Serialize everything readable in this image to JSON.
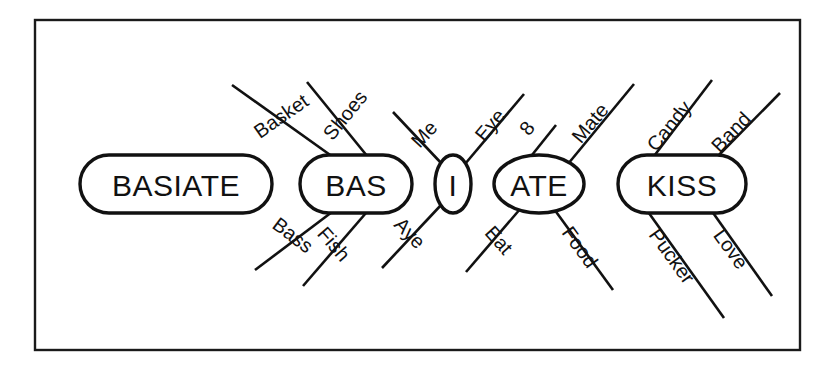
{
  "figure": {
    "background_color": "#ffffff",
    "stroke_color": "#111111",
    "frame": {
      "x": 35,
      "y": 20,
      "width": 765,
      "height": 330
    }
  },
  "nodes": [
    {
      "id": "basiate",
      "label": "BASIATE",
      "shape": "rounded-rect",
      "cx": 176,
      "cy": 184,
      "rx": 96,
      "ry": 29,
      "font_size": 30
    },
    {
      "id": "bas",
      "label": "BAS",
      "shape": "rounded-rect",
      "cx": 356,
      "cy": 184,
      "rx": 56,
      "ry": 29,
      "font_size": 30
    },
    {
      "id": "i",
      "label": "I",
      "shape": "ellipse",
      "cx": 453,
      "cy": 184,
      "rx": 18,
      "ry": 29,
      "font_size": 30
    },
    {
      "id": "ate",
      "label": "ATE",
      "shape": "ellipse",
      "cx": 539,
      "cy": 184,
      "rx": 45,
      "ry": 29,
      "font_size": 30
    },
    {
      "id": "kiss",
      "label": "KISS",
      "shape": "rounded-rect",
      "cx": 682,
      "cy": 184,
      "rx": 64,
      "ry": 29,
      "font_size": 30
    }
  ],
  "associations": [
    {
      "id": "bas-basket",
      "label": "Basket",
      "source_node": "bas",
      "direction": "upper-left",
      "x1": 340,
      "y1": 162,
      "x2": 232,
      "y2": 85,
      "label_x": 281,
      "label_y": 116,
      "label_rotation": -35,
      "font_size": 20
    },
    {
      "id": "bas-shoes",
      "label": "Shoes",
      "source_node": "bas",
      "direction": "upper-right",
      "x1": 372,
      "y1": 162,
      "x2": 307,
      "y2": 82,
      "label_x": 345,
      "label_y": 115,
      "label_rotation": -51,
      "font_size": 20
    },
    {
      "id": "bas-bass",
      "label": "Bass",
      "source_node": "bas",
      "direction": "lower-left",
      "x1": 340,
      "y1": 206,
      "x2": 255,
      "y2": 270,
      "label_x": 293,
      "label_y": 235,
      "label_rotation": 37,
      "font_size": 20
    },
    {
      "id": "bas-fish",
      "label": "Fish",
      "source_node": "bas",
      "direction": "lower-right",
      "x1": 372,
      "y1": 206,
      "x2": 303,
      "y2": 286,
      "label_x": 334,
      "label_y": 244,
      "label_rotation": 49,
      "font_size": 20
    },
    {
      "id": "i-me",
      "label": "Me",
      "source_node": "i",
      "direction": "upper-left",
      "x1": 442,
      "y1": 164,
      "x2": 393,
      "y2": 112,
      "label_x": 424,
      "label_y": 134,
      "label_rotation": -47,
      "font_size": 20
    },
    {
      "id": "i-eye",
      "label": "Eye",
      "source_node": "i",
      "direction": "upper-right",
      "x1": 465,
      "y1": 164,
      "x2": 524,
      "y2": 94,
      "label_x": 490,
      "label_y": 125,
      "label_rotation": -50,
      "font_size": 20
    },
    {
      "id": "i-aye",
      "label": "Aye",
      "source_node": "i",
      "direction": "lower-left",
      "x1": 442,
      "y1": 204,
      "x2": 382,
      "y2": 268,
      "label_x": 410,
      "label_y": 233,
      "label_rotation": 46,
      "font_size": 20
    },
    {
      "id": "ate-eight",
      "label": "8",
      "source_node": "ate",
      "direction": "upper-right-short",
      "x1": 528,
      "y1": 160,
      "x2": 556,
      "y2": 125,
      "label_x": 527,
      "label_y": 128,
      "label_rotation": -52,
      "font_size": 20
    },
    {
      "id": "ate-mate",
      "label": "Mate",
      "source_node": "ate",
      "direction": "upper-right",
      "x1": 563,
      "y1": 170,
      "x2": 634,
      "y2": 84,
      "label_x": 590,
      "label_y": 123,
      "label_rotation": -50,
      "font_size": 20
    },
    {
      "id": "ate-eat",
      "label": "Eat",
      "source_node": "ate",
      "direction": "lower-left",
      "x1": 521,
      "y1": 208,
      "x2": 466,
      "y2": 272,
      "label_x": 499,
      "label_y": 240,
      "label_rotation": 48,
      "font_size": 20
    },
    {
      "id": "ate-food",
      "label": "Food",
      "source_node": "ate",
      "direction": "lower-right",
      "x1": 554,
      "y1": 209,
      "x2": 613,
      "y2": 290,
      "label_x": 580,
      "label_y": 247,
      "label_rotation": 54,
      "font_size": 20
    },
    {
      "id": "kiss-candy",
      "label": "Candy",
      "source_node": "kiss",
      "direction": "upper-left",
      "x1": 651,
      "y1": 160,
      "x2": 712,
      "y2": 80,
      "label_x": 669,
      "label_y": 126,
      "label_rotation": -51,
      "font_size": 20
    },
    {
      "id": "kiss-band",
      "label": "Band",
      "source_node": "kiss",
      "direction": "upper-right",
      "x1": 714,
      "y1": 160,
      "x2": 780,
      "y2": 93,
      "label_x": 731,
      "label_y": 132,
      "label_rotation": -46,
      "font_size": 20
    },
    {
      "id": "kiss-pucker",
      "label": "Pucker",
      "source_node": "kiss",
      "direction": "lower-right",
      "x1": 646,
      "y1": 209,
      "x2": 724,
      "y2": 318,
      "label_x": 672,
      "label_y": 256,
      "label_rotation": 54,
      "font_size": 20
    },
    {
      "id": "kiss-love",
      "label": "Love",
      "source_node": "kiss",
      "direction": "lower-right-2",
      "x1": 711,
      "y1": 210,
      "x2": 772,
      "y2": 296,
      "label_x": 731,
      "label_y": 249,
      "label_rotation": 54,
      "font_size": 20
    }
  ]
}
